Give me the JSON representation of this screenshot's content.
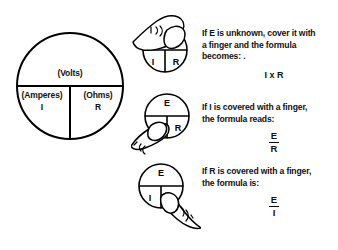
{
  "wheel": {
    "top": {
      "unit": "(Volts)",
      "symbol": ""
    },
    "bottom_left": {
      "unit": "(Amperes)",
      "symbol": "I"
    },
    "bottom_right": {
      "unit": "(Ohms)",
      "symbol": "R"
    }
  },
  "illustrations": [
    {
      "name": "finger-covers-e",
      "covered": "E",
      "visible_labels": [
        "I",
        "R"
      ],
      "top_label": "",
      "bottom_left_label": "I",
      "bottom_right_label": "R"
    },
    {
      "name": "finger-covers-i",
      "covered": "I",
      "visible_labels": [
        "E",
        "R"
      ],
      "top_label": "E",
      "bottom_left_label": "",
      "bottom_right_label": "R"
    },
    {
      "name": "finger-covers-r",
      "covered": "R",
      "visible_labels": [
        "E",
        "I"
      ],
      "top_label": "E",
      "bottom_left_label": "I",
      "bottom_right_label": ""
    }
  ],
  "blocks": [
    {
      "line1": "If E is unknown, cover it with",
      "line2": "a finger and the formula",
      "line3": "becomes:  .",
      "formula_inline": "I x R",
      "numerator": "",
      "denominator": ""
    },
    {
      "line1": "If I is covered with a finger,",
      "line2": "the formula reads:",
      "line3": "",
      "formula_inline": "",
      "numerator": "E",
      "denominator": "R"
    },
    {
      "line1": "If R is covered with a finger,",
      "line2": "the formula is:",
      "line3": "",
      "formula_inline": "",
      "numerator": "E",
      "denominator": "I"
    }
  ],
  "colors": {
    "ink": "#000000",
    "background": "#ffffff"
  }
}
